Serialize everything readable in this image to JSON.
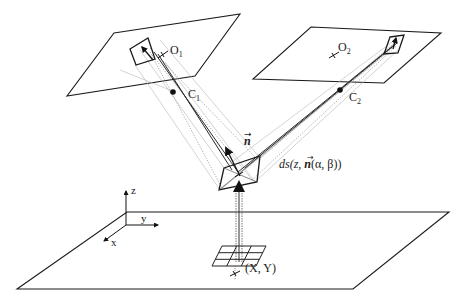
{
  "diagram": {
    "type": "stereo-camera-geometry",
    "labels": {
      "optical_center_1": "O",
      "optical_center_1_sub": "1",
      "optical_center_2": "O",
      "optical_center_2_sub": "2",
      "camera_center_1": "C",
      "camera_center_1_sub": "1",
      "camera_center_2": "C",
      "camera_center_2_sub": "2",
      "normal": "n",
      "surface_element": "ds(z, n(α, β))",
      "surface_element_prefix": "ds(z, ",
      "surface_element_n": "n",
      "surface_element_suffix": "(α, β))",
      "ground_point": "(X, Y)",
      "axis_x": "x",
      "axis_y": "y",
      "axis_z": "z"
    },
    "elements": [
      "left-image-plane",
      "right-image-plane",
      "ground-plane",
      "surface-patch",
      "normal-vector",
      "ground-grid",
      "coordinate-axes",
      "projection-rays"
    ],
    "colors": {
      "stroke": "#1a1a1a",
      "ray_dotted": "#8a8a8a",
      "ray_light": "#b5b5b5",
      "background": "#ffffff"
    }
  }
}
